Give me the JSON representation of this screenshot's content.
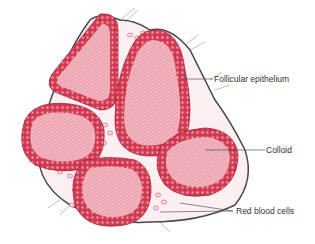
{
  "diagram": {
    "colors": {
      "colloid": "#f2b3bd",
      "colloid_hatch": "#d98a97",
      "epithelium": "#e0485e",
      "epithelium_cells": "#c22a42",
      "cell_nucleus": "#f6b7c1",
      "connective_tissue": "#4a4a4a",
      "rbc_fill": "#fbe3e7",
      "rbc_outline": "#e06a7e",
      "leader_line": "#555555",
      "label_text": "#333333"
    },
    "labels": [
      {
        "id": "follicular-epithelium",
        "text": "Follicular epithelium"
      },
      {
        "id": "colloid",
        "text": "Colloid"
      },
      {
        "id": "red-blood-cells",
        "text": "Red blood cells"
      }
    ],
    "structures": [
      {
        "name": "follicle-top-left",
        "shape": "tall triangular"
      },
      {
        "name": "follicle-top-center",
        "shape": "tall oval"
      },
      {
        "name": "follicle-mid-left",
        "shape": "rounded"
      },
      {
        "name": "follicle-bottom-center",
        "shape": "rounded"
      },
      {
        "name": "follicle-right",
        "shape": "oval"
      }
    ]
  }
}
